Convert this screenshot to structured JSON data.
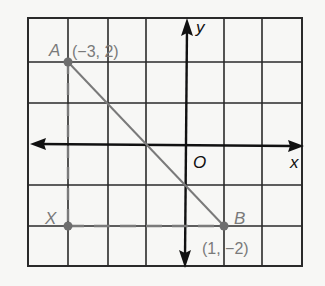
{
  "diagram": {
    "type": "coordinate-plane",
    "grid": {
      "cols": 7,
      "rows": 6,
      "x_range": [
        -4,
        3
      ],
      "y_range": [
        -3,
        3
      ]
    },
    "axes": {
      "x_label": "x",
      "y_label": "y",
      "origin_label": "O"
    },
    "points": [
      {
        "name": "A",
        "label": "A",
        "coords_label": "(−3, 2)",
        "x": -3,
        "y": 2
      },
      {
        "name": "B",
        "label": "B",
        "coords_label": "(1, −2)",
        "x": 1,
        "y": -2
      },
      {
        "name": "X",
        "label": "X",
        "coords_label": "",
        "x": -3,
        "y": -2
      }
    ],
    "segments": [
      {
        "from": "A",
        "to": "B",
        "style": "solid"
      },
      {
        "from": "A",
        "to": "X",
        "style": "dashed"
      },
      {
        "from": "X",
        "to": "B",
        "style": "dashed"
      }
    ],
    "colors": {
      "grid": "#2a2a2a",
      "axes": "#111111",
      "highlight": "#7a7a7a",
      "background": "#f7f7f5"
    }
  }
}
